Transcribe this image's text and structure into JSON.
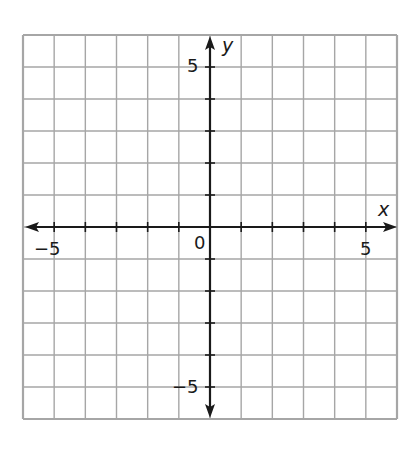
{
  "chart_data": {
    "type": "scatter",
    "title": "",
    "xlabel": "x",
    "ylabel": "y",
    "xlim": [
      -6,
      6
    ],
    "ylim": [
      -6,
      6
    ],
    "grid": true,
    "grid_step": 1,
    "tick_labels": {
      "x": [
        {
          "value": -5,
          "label": "−5"
        },
        {
          "value": 5,
          "label": "5"
        }
      ],
      "y": [
        {
          "value": 5,
          "label": "5"
        },
        {
          "value": -5,
          "label": "−5"
        }
      ],
      "origin": "0"
    },
    "series": [],
    "legend": null
  },
  "labels": {
    "x_axis": "x",
    "y_axis": "y",
    "origin": "0",
    "x_neg5": "−5",
    "x_pos5": "5",
    "y_pos5": "5",
    "y_neg5": "−5"
  },
  "colors": {
    "grid": "#a6a6a6",
    "axis": "#1a1a1a",
    "background": "#ffffff"
  }
}
